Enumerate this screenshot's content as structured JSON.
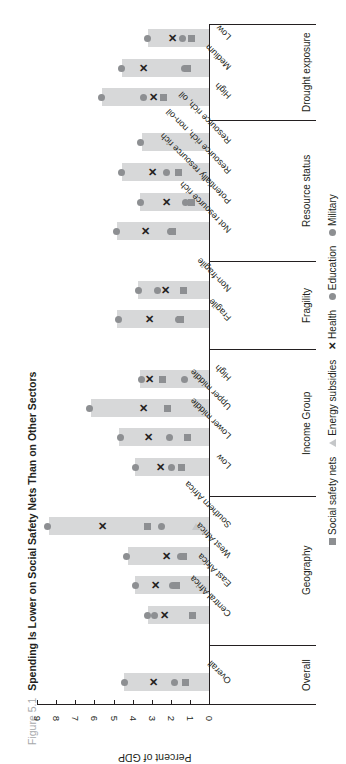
{
  "figure": {
    "label": "Figure 5.1",
    "title": "Spending Is Lower on Social Safety Nets Than on Other Sectors"
  },
  "axis": {
    "ylabel": "Percent of GDP",
    "ticks": [
      "0",
      "1",
      "2",
      "3",
      "4",
      "5",
      "6",
      "7",
      "8",
      "9"
    ]
  },
  "legend": {
    "items": [
      {
        "label": "Social safety nets",
        "marker": "square-icon"
      },
      {
        "label": "Energy subsidies",
        "marker": "triangle-icon"
      },
      {
        "label": "Health",
        "marker": "x-icon"
      },
      {
        "label": "Education",
        "marker": "circle-icon"
      },
      {
        "label": "Military",
        "marker": "circle-icon"
      }
    ]
  },
  "groups": [
    {
      "label": "Overall"
    },
    {
      "label": "Geography"
    },
    {
      "label": "Income Group"
    },
    {
      "label": "Fragility"
    },
    {
      "label": "Resource status"
    },
    {
      "label": "Drought exposure"
    }
  ],
  "chart_data": {
    "type": "bar",
    "title": "Spending Is Lower on Social Safety Nets Than on Other Sectors",
    "xlabel": "",
    "ylabel": "Percent of GDP",
    "ylim": [
      0,
      9
    ],
    "grid": false,
    "legend_position": "bottom",
    "orientation": "vertical bars, image rotated 90 degrees counter-clockwise",
    "categories": [
      "Overall",
      "Central Africa",
      "East Africa",
      "West Africa",
      "Southern Africa",
      "Low",
      "Lower middle",
      "Upper middle",
      "High",
      "Fragile",
      "Non-fragile",
      "Not resource rich",
      "Potentially resource rich",
      "Resource rich, non-oil",
      "Resource rich, oil",
      "High",
      "Medium",
      "Low"
    ],
    "category_groups": [
      "Overall",
      "Geography",
      "Geography",
      "Geography",
      "Geography",
      "Income Group",
      "Income Group",
      "Income Group",
      "Income Group",
      "Fragility",
      "Fragility",
      "Resource status",
      "Resource status",
      "Resource status",
      "Resource status",
      "Drought exposure",
      "Drought exposure",
      "Drought exposure"
    ],
    "series": [
      {
        "name": "Total (bar)",
        "values": [
          4.45,
          3.2,
          3.9,
          4.25,
          8.4,
          3.9,
          4.7,
          6.2,
          3.6,
          4.8,
          3.7,
          4.8,
          3.6,
          4.55,
          3.5,
          5.6,
          4.55,
          3.2
        ]
      },
      {
        "name": "Social safety nets",
        "values": [
          1.25,
          0.85,
          1.7,
          1.35,
          3.2,
          1.45,
          1.15,
          2.15,
          2.45,
          1.5,
          1.35,
          1.9,
          0.9,
          1.6,
          null,
          2.4,
          1.15,
          0.9
        ]
      },
      {
        "name": "Energy subsidies",
        "values": [
          null,
          null,
          null,
          null,
          0.7,
          null,
          null,
          null,
          null,
          null,
          null,
          null,
          null,
          null,
          null,
          null,
          null,
          null
        ]
      },
      {
        "name": "Health",
        "values": [
          2.9,
          2.35,
          2.8,
          2.2,
          5.55,
          2.55,
          3.15,
          3.45,
          3.1,
          3.1,
          2.3,
          3.35,
          2.2,
          2.95,
          null,
          2.9,
          3.45,
          1.9
        ]
      },
      {
        "name": "Education",
        "values": [
          1.8,
          2.85,
          1.9,
          1.5,
          2.5,
          1.95,
          2.05,
          2.15,
          1.3,
          1.6,
          2.7,
          2.0,
          1.25,
          2.25,
          null,
          3.45,
          1.3,
          1.4
        ]
      },
      {
        "name": "Military",
        "values": [
          4.45,
          3.2,
          3.85,
          4.3,
          8.45,
          3.85,
          4.65,
          6.25,
          3.55,
          4.75,
          3.7,
          4.85,
          3.6,
          4.6,
          3.6,
          5.65,
          4.6,
          3.2
        ]
      }
    ]
  }
}
